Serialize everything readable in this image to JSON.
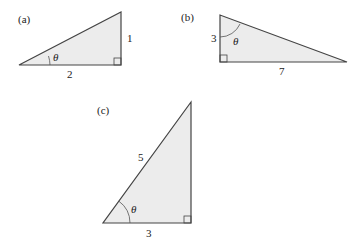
{
  "figures": [
    {
      "label": "(a)",
      "angle": "θ",
      "opposite": "1",
      "adjacent": "2",
      "hypotenuse": ""
    },
    {
      "label": "(b)",
      "angle": "θ",
      "adjacent": "3",
      "opposite": "7",
      "hypotenuse": ""
    },
    {
      "label": "(c)",
      "angle": "θ",
      "hypotenuse": "5",
      "adjacent": "3",
      "opposite": ""
    }
  ],
  "colors": {
    "fill": "#ececec",
    "stroke": "#444444"
  }
}
